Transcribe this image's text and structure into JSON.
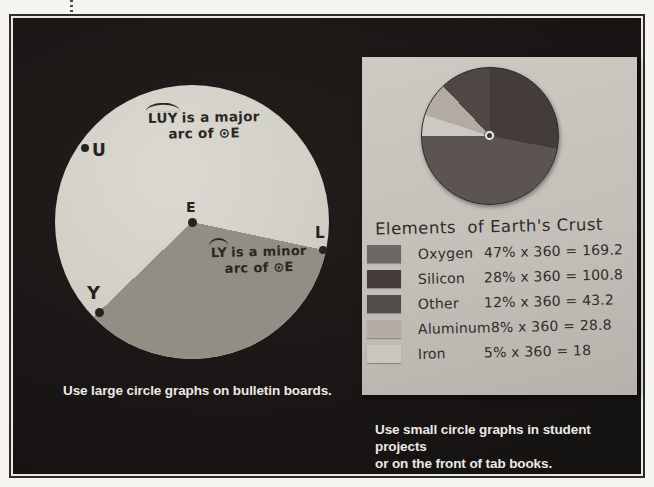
{
  "left_panel": {
    "points": {
      "u": "U",
      "e": "E",
      "l": "L",
      "y": "Y"
    },
    "major_annotation": {
      "arc_over": "LUY",
      "line1_rest": "is a major",
      "line2": "arc of ⊙E"
    },
    "minor_annotation": {
      "arc_over": "LY",
      "line1_rest": "is a minor",
      "line2": "arc of ⊙E"
    },
    "caption": "Use large circle graphs on bulletin boards."
  },
  "right_panel": {
    "title": "Elements  of Earth's Crust",
    "legend_rows": [
      {
        "element": "Oxygen",
        "formula": "47% x 360 = 169.2",
        "swatch_color": "#6e6865"
      },
      {
        "element": "Silicon",
        "formula": "28% x 360 = 100.8",
        "swatch_color": "#433c3a"
      },
      {
        "element": "Other",
        "formula": "12% x 360 = 43.2",
        "swatch_color": "#544c49"
      },
      {
        "element": "Aluminum",
        "formula": "8% x 360 = 28.8",
        "swatch_color": "#b4ada6"
      },
      {
        "element": "Iron",
        "formula": "5% x 360 = 18",
        "swatch_color": "#cbc6bf"
      }
    ],
    "caption_line1": "Use small circle graphs in student projects",
    "caption_line2": "or on the front of tab books."
  },
  "chart_data": {
    "type": "pie",
    "title": "Elements of Earth's Crust",
    "categories": [
      "Oxygen",
      "Silicon",
      "Other",
      "Aluminum",
      "Iron"
    ],
    "values": [
      47,
      28,
      12,
      8,
      5
    ],
    "unit": "percent",
    "degrees": [
      169.2,
      100.8,
      43.2,
      28.8,
      18
    ],
    "legend_position": "below",
    "render_order_clockwise_from_top": [
      "Silicon",
      "Oxygen",
      "Iron",
      "Aluminum",
      "Other"
    ],
    "slice_colors": {
      "Oxygen": "#5b5450",
      "Silicon": "#433c3a",
      "Other": "#4f4744",
      "Aluminum": "#b2aba3",
      "Iron": "#cdc8c1"
    }
  },
  "colors": {
    "page_background": "#f7f5f2",
    "board_background": "#191614",
    "paper_background": "#c6c2bb",
    "circle_face": "#d6d3cc",
    "minor_sector": "#918e85",
    "ink": "#26231f",
    "caption_text": "#ebe9e4"
  }
}
